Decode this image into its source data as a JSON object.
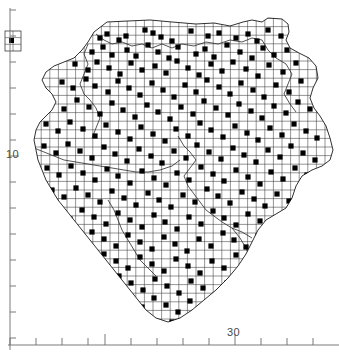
{
  "figure": {
    "type": "distribution-map",
    "background_color": "#ffffff",
    "ink_color": "#1a1a1a",
    "grid_color": "#3a3a3a",
    "axis_color": "#6b6b6b",
    "dot_color": "#000000"
  },
  "axes": {
    "x": {
      "label_values": [
        "30"
      ],
      "labels": [
        {
          "text": "30",
          "x": 237,
          "y": 333
        }
      ],
      "tick_positions": [
        10,
        36,
        62,
        88,
        105,
        131,
        157,
        183,
        209,
        235,
        261,
        287,
        313
      ],
      "major_tick_positions": [
        105,
        235
      ],
      "axis_line_y": 345,
      "axis_line_x0": 8,
      "axis_line_x1": 339
    },
    "y": {
      "label_values": [
        "10"
      ],
      "labels": [
        {
          "text": "10",
          "x": 8,
          "y": 155
        }
      ],
      "tick_positions": [
        10,
        36,
        62,
        88,
        114,
        140,
        156,
        182,
        208,
        234,
        260,
        286,
        312,
        338
      ],
      "major_tick_positions": [
        156,
        26
      ],
      "axis_line_x": 10,
      "axis_line_y0": 8,
      "axis_line_y1": 350
    }
  },
  "inset": {
    "name": "outlier-grid-inset",
    "x": 5,
    "y": 31,
    "width": 16,
    "height": 20,
    "cols": 2,
    "rows": 3,
    "has_marker": true
  },
  "grid": {
    "cell_size": 8.6,
    "origin_x": 24.0,
    "origin_y": 18.0,
    "line_width": 0.55
  },
  "chart_data": {
    "type": "scatter",
    "title": "",
    "xlabel": "",
    "ylabel": "",
    "grid": true,
    "legend": "none",
    "note": "Filled squares mark occupied grid cells within the mapped region outline.",
    "occupied_cells_count": 236,
    "points": [
      [
        100,
        38
      ],
      [
        107,
        34
      ],
      [
        119,
        40
      ],
      [
        126,
        36
      ],
      [
        145,
        30
      ],
      [
        153,
        33
      ],
      [
        161,
        37
      ],
      [
        172,
        41
      ],
      [
        191,
        31
      ],
      [
        208,
        36
      ],
      [
        219,
        33
      ],
      [
        236,
        38
      ],
      [
        248,
        34
      ],
      [
        257,
        41
      ],
      [
        268,
        30
      ],
      [
        281,
        36
      ],
      [
        292,
        33
      ],
      [
        92,
        52
      ],
      [
        103,
        47
      ],
      [
        112,
        55
      ],
      [
        127,
        50
      ],
      [
        136,
        56
      ],
      [
        148,
        45
      ],
      [
        158,
        52
      ],
      [
        169,
        58
      ],
      [
        178,
        47
      ],
      [
        196,
        54
      ],
      [
        205,
        49
      ],
      [
        214,
        57
      ],
      [
        227,
        45
      ],
      [
        240,
        52
      ],
      [
        252,
        58
      ],
      [
        263,
        48
      ],
      [
        274,
        55
      ],
      [
        287,
        50
      ],
      [
        75,
        64
      ],
      [
        88,
        70
      ],
      [
        97,
        62
      ],
      [
        109,
        68
      ],
      [
        120,
        74
      ],
      [
        131,
        63
      ],
      [
        142,
        70
      ],
      [
        155,
        66
      ],
      [
        166,
        73
      ],
      [
        177,
        61
      ],
      [
        188,
        68
      ],
      [
        199,
        75
      ],
      [
        211,
        64
      ],
      [
        222,
        71
      ],
      [
        233,
        62
      ],
      [
        246,
        69
      ],
      [
        258,
        76
      ],
      [
        269,
        65
      ],
      [
        283,
        72
      ],
      [
        296,
        63
      ],
      [
        62,
        82
      ],
      [
        73,
        88
      ],
      [
        86,
        79
      ],
      [
        95,
        86
      ],
      [
        108,
        92
      ],
      [
        118,
        81
      ],
      [
        129,
        88
      ],
      [
        140,
        95
      ],
      [
        152,
        83
      ],
      [
        163,
        90
      ],
      [
        174,
        97
      ],
      [
        185,
        85
      ],
      [
        196,
        92
      ],
      [
        207,
        80
      ],
      [
        219,
        87
      ],
      [
        230,
        94
      ],
      [
        241,
        83
      ],
      [
        253,
        90
      ],
      [
        264,
        97
      ],
      [
        276,
        85
      ],
      [
        289,
        92
      ],
      [
        301,
        81
      ],
      [
        52,
        102
      ],
      [
        64,
        109
      ],
      [
        77,
        100
      ],
      [
        89,
        107
      ],
      [
        100,
        114
      ],
      [
        112,
        103
      ],
      [
        123,
        110
      ],
      [
        135,
        117
      ],
      [
        147,
        105
      ],
      [
        158,
        112
      ],
      [
        170,
        119
      ],
      [
        181,
        107
      ],
      [
        193,
        114
      ],
      [
        204,
        101
      ],
      [
        216,
        108
      ],
      [
        228,
        115
      ],
      [
        239,
        104
      ],
      [
        251,
        111
      ],
      [
        262,
        118
      ],
      [
        274,
        106
      ],
      [
        286,
        113
      ],
      [
        298,
        102
      ],
      [
        310,
        109
      ],
      [
        46,
        124
      ],
      [
        58,
        131
      ],
      [
        70,
        122
      ],
      [
        83,
        129
      ],
      [
        95,
        136
      ],
      [
        106,
        125
      ],
      [
        118,
        132
      ],
      [
        130,
        139
      ],
      [
        141,
        127
      ],
      [
        153,
        134
      ],
      [
        165,
        141
      ],
      [
        176,
        129
      ],
      [
        188,
        136
      ],
      [
        200,
        123
      ],
      [
        211,
        130
      ],
      [
        223,
        137
      ],
      [
        235,
        126
      ],
      [
        247,
        133
      ],
      [
        258,
        140
      ],
      [
        270,
        128
      ],
      [
        282,
        135
      ],
      [
        294,
        124
      ],
      [
        306,
        131
      ],
      [
        317,
        138
      ],
      [
        44,
        146
      ],
      [
        56,
        153
      ],
      [
        68,
        144
      ],
      [
        80,
        151
      ],
      [
        92,
        158
      ],
      [
        104,
        147
      ],
      [
        115,
        154
      ],
      [
        127,
        161
      ],
      [
        139,
        149
      ],
      [
        151,
        156
      ],
      [
        162,
        163
      ],
      [
        174,
        151
      ],
      [
        186,
        158
      ],
      [
        197,
        145
      ],
      [
        209,
        152
      ],
      [
        221,
        159
      ],
      [
        233,
        148
      ],
      [
        244,
        155
      ],
      [
        256,
        162
      ],
      [
        268,
        150
      ],
      [
        280,
        157
      ],
      [
        291,
        146
      ],
      [
        303,
        153
      ],
      [
        315,
        160
      ],
      [
        47,
        168
      ],
      [
        59,
        175
      ],
      [
        71,
        166
      ],
      [
        83,
        173
      ],
      [
        95,
        180
      ],
      [
        107,
        169
      ],
      [
        118,
        176
      ],
      [
        130,
        183
      ],
      [
        142,
        171
      ],
      [
        154,
        178
      ],
      [
        166,
        185
      ],
      [
        177,
        173
      ],
      [
        189,
        180
      ],
      [
        201,
        167
      ],
      [
        213,
        174
      ],
      [
        224,
        181
      ],
      [
        236,
        170
      ],
      [
        248,
        177
      ],
      [
        260,
        184
      ],
      [
        271,
        172
      ],
      [
        283,
        179
      ],
      [
        295,
        168
      ],
      [
        307,
        175
      ],
      [
        52,
        190
      ],
      [
        64,
        197
      ],
      [
        76,
        188
      ],
      [
        88,
        195
      ],
      [
        100,
        202
      ],
      [
        112,
        191
      ],
      [
        124,
        198
      ],
      [
        136,
        205
      ],
      [
        148,
        193
      ],
      [
        159,
        200
      ],
      [
        171,
        207
      ],
      [
        183,
        195
      ],
      [
        195,
        202
      ],
      [
        207,
        189
      ],
      [
        218,
        196
      ],
      [
        230,
        203
      ],
      [
        242,
        192
      ],
      [
        254,
        199
      ],
      [
        265,
        206
      ],
      [
        277,
        194
      ],
      [
        289,
        201
      ],
      [
        301,
        190
      ],
      [
        58,
        212
      ],
      [
        70,
        219
      ],
      [
        82,
        210
      ],
      [
        94,
        217
      ],
      [
        106,
        224
      ],
      [
        118,
        213
      ],
      [
        130,
        220
      ],
      [
        142,
        227
      ],
      [
        154,
        215
      ],
      [
        165,
        222
      ],
      [
        177,
        229
      ],
      [
        189,
        217
      ],
      [
        201,
        224
      ],
      [
        213,
        211
      ],
      [
        224,
        218
      ],
      [
        236,
        225
      ],
      [
        248,
        214
      ],
      [
        260,
        221
      ],
      [
        272,
        228
      ],
      [
        283,
        216
      ],
      [
        295,
        223
      ],
      [
        68,
        234
      ],
      [
        80,
        241
      ],
      [
        92,
        232
      ],
      [
        104,
        239
      ],
      [
        116,
        246
      ],
      [
        128,
        235
      ],
      [
        140,
        242
      ],
      [
        152,
        249
      ],
      [
        164,
        237
      ],
      [
        175,
        244
      ],
      [
        187,
        251
      ],
      [
        199,
        239
      ],
      [
        211,
        246
      ],
      [
        223,
        233
      ],
      [
        234,
        240
      ],
      [
        246,
        247
      ],
      [
        258,
        236
      ],
      [
        270,
        243
      ],
      [
        282,
        250
      ],
      [
        80,
        256
      ],
      [
        92,
        263
      ],
      [
        104,
        254
      ],
      [
        116,
        261
      ],
      [
        128,
        268
      ],
      [
        140,
        257
      ],
      [
        152,
        264
      ],
      [
        164,
        271
      ],
      [
        176,
        259
      ],
      [
        188,
        266
      ],
      [
        200,
        273
      ],
      [
        212,
        261
      ],
      [
        224,
        268
      ],
      [
        236,
        255
      ],
      [
        248,
        262
      ],
      [
        260,
        269
      ],
      [
        272,
        258
      ],
      [
        95,
        278
      ],
      [
        107,
        285
      ],
      [
        119,
        276
      ],
      [
        131,
        283
      ],
      [
        143,
        290
      ],
      [
        155,
        279
      ],
      [
        167,
        286
      ],
      [
        179,
        293
      ],
      [
        191,
        281
      ],
      [
        203,
        288
      ],
      [
        215,
        295
      ],
      [
        227,
        283
      ],
      [
        239,
        290
      ],
      [
        251,
        277
      ],
      [
        130,
        300
      ],
      [
        142,
        307
      ],
      [
        154,
        298
      ],
      [
        166,
        305
      ],
      [
        178,
        312
      ],
      [
        190,
        301
      ],
      [
        202,
        308
      ],
      [
        214,
        315
      ],
      [
        226,
        303
      ],
      [
        238,
        310
      ],
      [
        172,
        322
      ],
      [
        184,
        328
      ],
      [
        196,
        320
      ],
      [
        208,
        326
      ]
    ]
  }
}
